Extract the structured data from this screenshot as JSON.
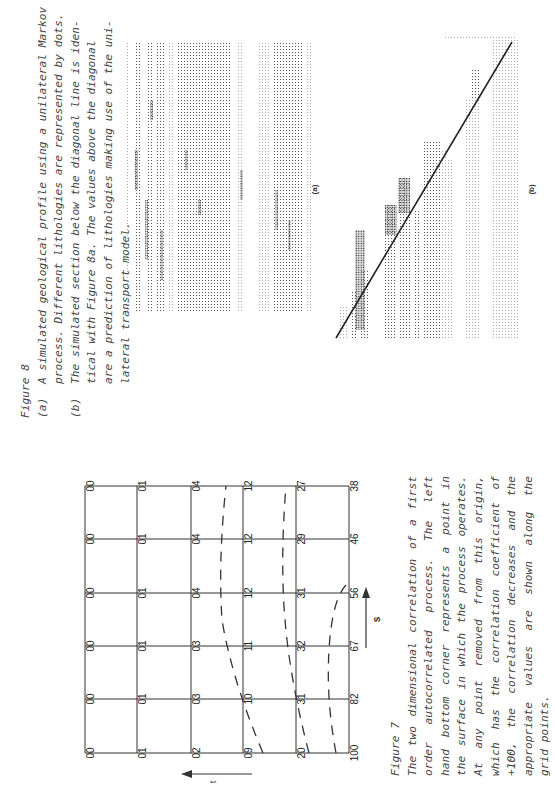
{
  "figure8": {
    "title": "Figure 8",
    "caption_a_marker": "(a)",
    "caption_a_lines": [
      "A simulated geological profile using a unilateral Markov",
      "process.  Different lithologies are represented by dots."
    ],
    "caption_b_marker": "(b)",
    "caption_b_lines": [
      "The simulated section below the diagonal line is iden-",
      "tical with Figure 8a.   The values above the diagonal",
      "are a prediction of lithologies making use of the uni-",
      "lateral transport model."
    ],
    "panel_a_label": "(a)",
    "panel_b_label": "(b)"
  },
  "figure7": {
    "title": "Figure 7",
    "caption_lines": [
      "The two dimensional correlation of a first",
      "order  autocorrelated  process.   The  left",
      "hand bottom corner represents a point in",
      "the surface in which the process operates.",
      "At  any  point  removed  from  this  origin,",
      "which has the correlation coefficient of",
      "+100,  the  correlation  decreases and the",
      "appropriate  values  are  shown  along  the",
      "grid points."
    ],
    "axis_t_label": "t",
    "axis_s_label": "s",
    "grid_rows_bottom_to_top": [
      [
        "100",
        "82",
        "67",
        "56",
        "46",
        "38"
      ],
      [
        "20",
        "31",
        "32",
        "31",
        "29",
        "27"
      ],
      [
        "09",
        "10",
        "11",
        "12",
        "12",
        "12"
      ],
      [
        "02",
        "03",
        "03",
        "04",
        "04",
        "04"
      ],
      [
        "01",
        "01",
        "01",
        "01",
        "01",
        "01"
      ],
      [
        "00",
        "00",
        "00",
        "00",
        "00",
        "00"
      ]
    ]
  }
}
